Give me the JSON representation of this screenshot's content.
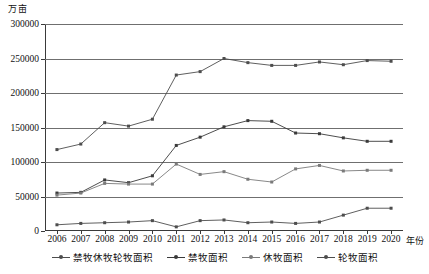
{
  "chart_data": {
    "type": "line",
    "title": "",
    "ylabel": "万亩",
    "xlabel": "年份",
    "ylim": [
      0,
      300000
    ],
    "ytick_step": 50000,
    "yticks": [
      "0",
      "50000",
      "100000",
      "150000",
      "200000",
      "250000",
      "300000"
    ],
    "grid": true,
    "legend_position": "bottom",
    "categories": [
      "2006",
      "2007",
      "2008",
      "2009",
      "2010",
      "2011",
      "2012",
      "2013",
      "2014",
      "2015",
      "2016",
      "2017",
      "2018",
      "2019",
      "2020"
    ],
    "series": [
      {
        "name": "禁牧休牧轮牧面积",
        "color": "#4d4d4d",
        "values": [
          118000,
          126000,
          157000,
          152000,
          162000,
          226000,
          231000,
          250000,
          244000,
          240000,
          240000,
          245000,
          241000,
          247000,
          246000
        ]
      },
      {
        "name": "禁牧面积",
        "color": "#3a3a3a",
        "values": [
          55000,
          56000,
          74000,
          70000,
          80000,
          124000,
          136000,
          151000,
          160000,
          159000,
          142000,
          141000,
          135000,
          130000,
          130000
        ]
      },
      {
        "name": "休牧面积",
        "color": "#7a7a7a",
        "values": [
          52000,
          55000,
          69000,
          68000,
          68000,
          97000,
          82000,
          86000,
          75000,
          71000,
          90000,
          95000,
          87000,
          88000,
          88000
        ]
      },
      {
        "name": "轮牧面积",
        "color": "#4d4d4d",
        "values": [
          9000,
          11000,
          12000,
          13000,
          15000,
          6000,
          15000,
          16000,
          12000,
          13000,
          11000,
          13000,
          23000,
          33000,
          33000
        ]
      }
    ]
  }
}
